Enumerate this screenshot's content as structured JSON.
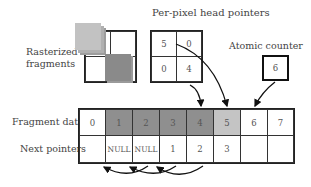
{
  "title": "Per-pixel head pointers",
  "labels": {
    "rasterized_line1": "Rasterized",
    "rasterized_line2": "fragments",
    "atomic_counter": "Atomic counter",
    "fragment_data": "Fragment data",
    "next_pointers": "Next pointers"
  },
  "head_pointers": [
    "5",
    "0",
    "0",
    "4"
  ],
  "atomic_counter_value": "6",
  "fragment_data": [
    "0",
    "1",
    "2",
    "3",
    "4",
    "5",
    "6",
    "7"
  ],
  "next_pointers": [
    "",
    "NULL",
    "NULL",
    "1",
    "2",
    "3",
    "",
    ""
  ],
  "colors": {
    "light_fragment": "#bdbdbd",
    "dark_fragment": "#8a8a8a",
    "used_cell": "#8f8f8f",
    "newest_cell": "#c4c4c4",
    "border": "#222222"
  }
}
